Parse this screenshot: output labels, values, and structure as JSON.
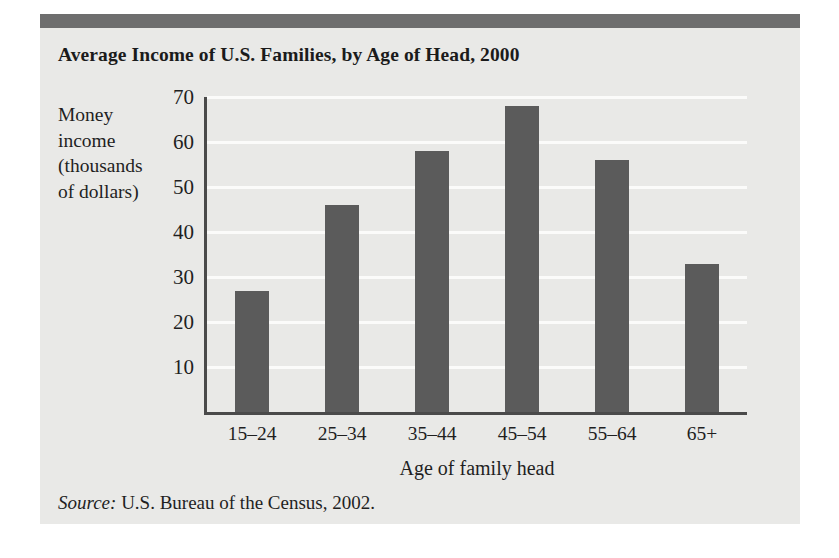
{
  "figure": {
    "title": "Average Income of U.S. Families, by Age of Head, 2000",
    "source_word": "Source:",
    "source_text": "U.S. Bureau of the Census, 2002.",
    "colors": {
      "panel_background": "#e9e9e7",
      "top_rule": "#6e6e6e",
      "bar_fill": "#5b5b5b",
      "gridline": "#fbfbfa",
      "axis_line": "#4a4a4a",
      "text": "#1f1f1f"
    }
  },
  "ylabel_lines": [
    "Money",
    "income",
    "(thousands",
    "of dollars)"
  ],
  "chart_data": {
    "type": "bar",
    "title": "Average Income of U.S. Families, by Age of Head, 2000",
    "xlabel": "Age of family head",
    "ylabel": "Money income (thousands of dollars)",
    "categories": [
      "15–24",
      "25–34",
      "35–44",
      "45–54",
      "55–64",
      "65+"
    ],
    "values": [
      27,
      46,
      58,
      68,
      56,
      33
    ],
    "yticks": [
      10,
      20,
      30,
      40,
      50,
      60,
      70
    ],
    "ytick_labels": [
      "10",
      "20",
      "30",
      "40",
      "50",
      "60",
      "70"
    ],
    "ylim": [
      0,
      70
    ],
    "grid": true,
    "grid_axis": "y",
    "legend": false,
    "series": [
      {
        "name": "Average money income",
        "values": [
          27,
          46,
          58,
          68,
          56,
          33
        ]
      }
    ]
  }
}
